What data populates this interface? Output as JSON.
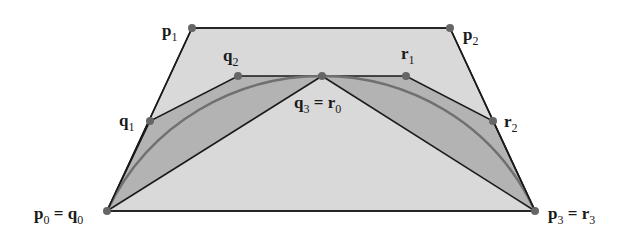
{
  "diagram": {
    "colors": {
      "background": "#ffffff",
      "outer_fill": "#d9d9d9",
      "inner_fill": "#b3b3b3",
      "edge": "#1a1a1a",
      "curve": "#707070",
      "point": "#666666"
    },
    "points": {
      "p0": [
        107,
        211
      ],
      "p1": [
        192,
        28
      ],
      "p2": [
        450,
        28
      ],
      "p3": [
        535,
        211
      ],
      "q1": [
        150,
        121
      ],
      "q2": [
        238,
        76
      ],
      "q3": [
        322,
        76
      ],
      "r1": [
        406,
        76
      ],
      "r2": [
        493,
        121
      ]
    },
    "labels": {
      "p1": {
        "base": "p",
        "sub": "1",
        "suffix": "",
        "suffix_sub": ""
      },
      "p2": {
        "base": "p",
        "sub": "2",
        "suffix": "",
        "suffix_sub": ""
      },
      "q1": {
        "base": "q",
        "sub": "1",
        "suffix": "",
        "suffix_sub": ""
      },
      "q2": {
        "base": "q",
        "sub": "2",
        "suffix": "",
        "suffix_sub": ""
      },
      "r1": {
        "base": "r",
        "sub": "1",
        "suffix": "",
        "suffix_sub": ""
      },
      "r2": {
        "base": "r",
        "sub": "2",
        "suffix": "",
        "suffix_sub": ""
      },
      "q3r0": {
        "base": "q",
        "sub": "3",
        "eq": " = ",
        "suffix": "r",
        "suffix_sub": "0"
      },
      "p0q0": {
        "base": "p",
        "sub": "0",
        "eq": " = ",
        "suffix": "q",
        "suffix_sub": "0"
      },
      "p3r3": {
        "base": "p",
        "sub": "3",
        "eq": " = ",
        "suffix": "r",
        "suffix_sub": "3"
      }
    }
  }
}
